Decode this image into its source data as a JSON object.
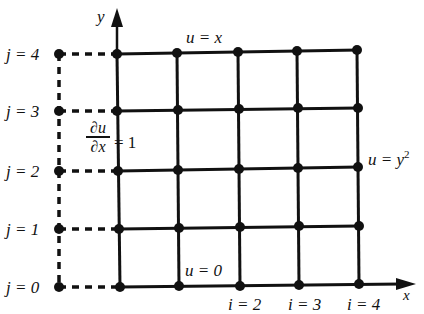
{
  "diagram": {
    "axes": {
      "x_label": "x",
      "y_label": "y"
    },
    "grid": {
      "columns": 5,
      "rows": 5,
      "row_labels": [
        "j = 0",
        "j = 1",
        "j = 2",
        "j = 3",
        "j = 4"
      ],
      "column_labels_partial": [
        "i = 2",
        "i = 3",
        "i = 4"
      ]
    },
    "boundary_conditions": {
      "top": "u = x",
      "bottom": "u = 0",
      "right_u": "u = y",
      "right_exp": "2",
      "left_num": "∂u",
      "left_den": "∂x",
      "left_rhs": "= 1"
    },
    "colors": {
      "line": "#111111",
      "background": "#ffffff"
    }
  }
}
